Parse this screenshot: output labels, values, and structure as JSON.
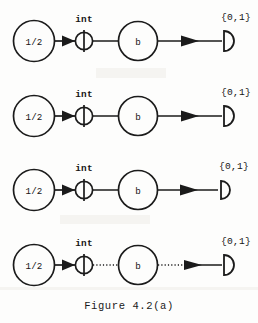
{
  "figure": {
    "caption": "Figure 4.2(a)",
    "rows": [
      {
        "id": "row-1",
        "source_label": "1/2",
        "integrator_label": "int",
        "process_label": "b",
        "output_label": "{0,1}",
        "link_style": "solid"
      },
      {
        "id": "row-2",
        "source_label": "1/2",
        "integrator_label": "int",
        "process_label": "b",
        "output_label": "{0,1}",
        "link_style": "solid"
      },
      {
        "id": "row-3",
        "source_label": "1/2",
        "integrator_label": "int",
        "process_label": "b",
        "output_label": "{0,1}",
        "link_style": "solid"
      },
      {
        "id": "row-4",
        "source_label": "1/2",
        "integrator_label": "int",
        "process_label": "b",
        "output_label": "{0,1}",
        "link_style": "dotted"
      }
    ],
    "icons": {
      "source_node": "circle-node-icon",
      "integrator_node": "integrator-circle-icon",
      "process_node": "circle-node-icon",
      "output_terminal": "half-disc-terminal-icon",
      "connector": "arrow-icon"
    },
    "colors": {
      "ink": "#1b1b1b",
      "paper": "#fdfdfc"
    }
  }
}
